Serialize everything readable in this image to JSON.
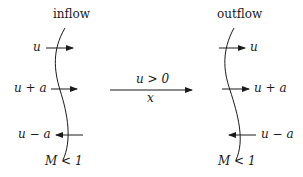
{
  "left_panel": {
    "title": "inflow",
    "arrows": [
      {
        "label": "u",
        "direction": "right"
      },
      {
        "label": "u + a",
        "direction": "right"
      },
      {
        "label": "u − a",
        "direction": "left"
      }
    ],
    "condition": "M < 1"
  },
  "right_panel": {
    "title": "outflow",
    "arrows": [
      {
        "label": "u",
        "direction": "right"
      },
      {
        "label": "u + a",
        "direction": "right"
      },
      {
        "label": "u − a",
        "direction": "left"
      }
    ],
    "condition": "M < 1"
  },
  "center_arrow": {
    "label_top": "u > 0",
    "label_bottom": "x",
    "direction": "right"
  },
  "colors": {
    "stroke": "#1a1a1a",
    "background": "#ffffff"
  }
}
